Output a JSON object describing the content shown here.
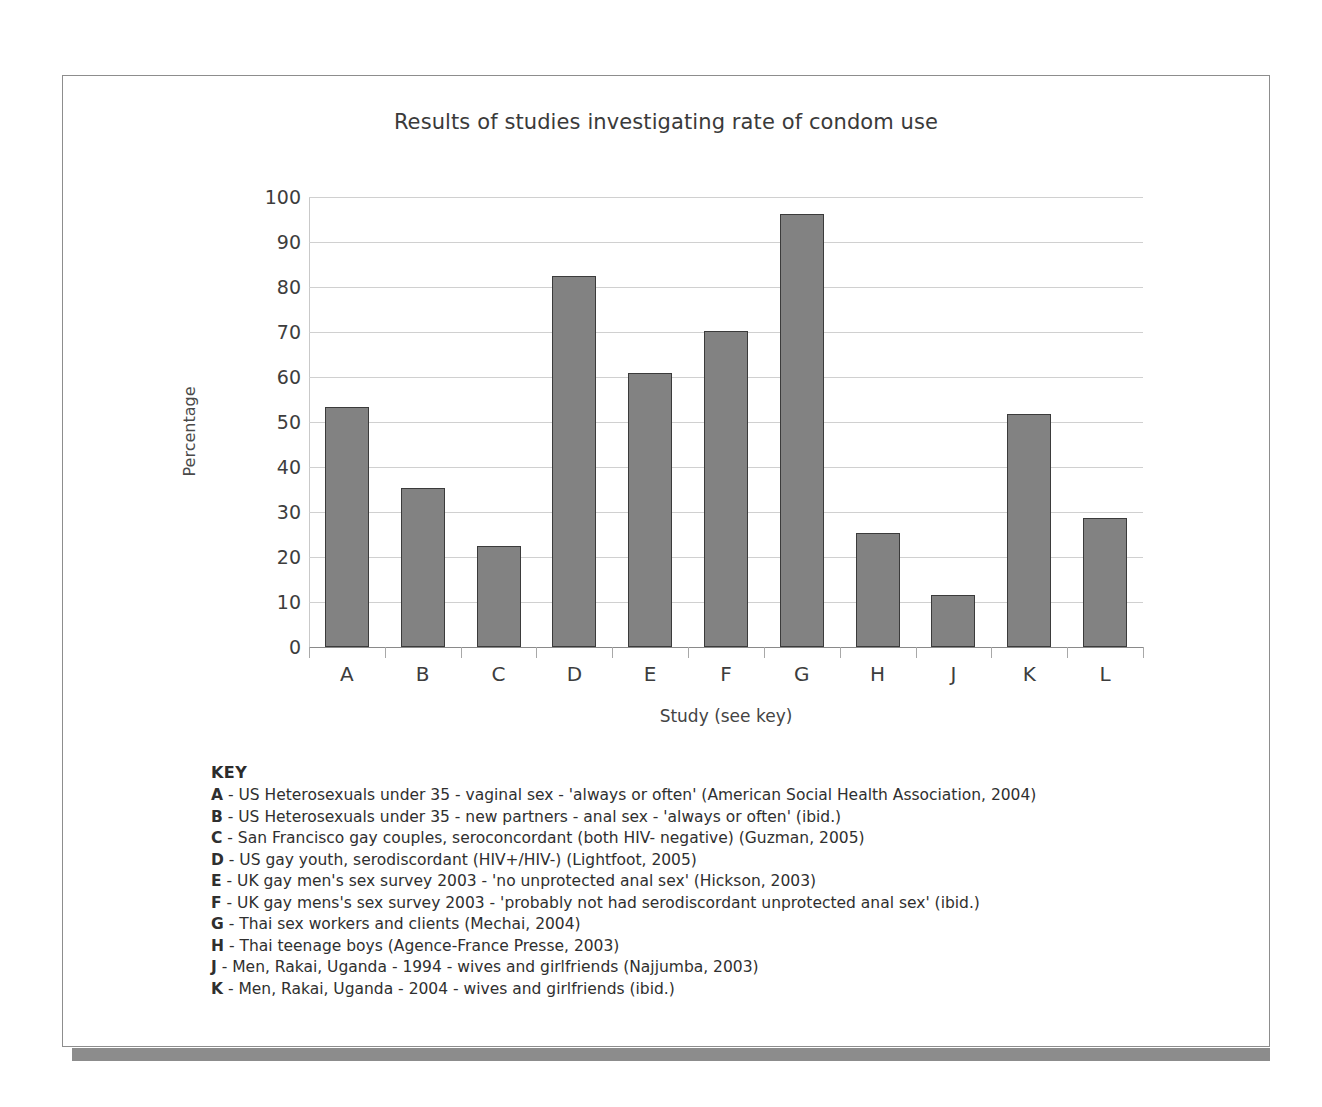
{
  "chart_data": {
    "type": "bar",
    "title": "Results of studies investigating rate of condom use",
    "xlabel": "Study (see key)",
    "ylabel": "Percentage",
    "ylim": [
      0,
      100
    ],
    "ytick_step": 10,
    "yticks": [
      "100",
      "90",
      "80",
      "70",
      "60",
      "50",
      "40",
      "30",
      "20",
      "10",
      "0"
    ],
    "grid": true,
    "legend_position": "below-plot",
    "bar_color": "#828282",
    "bar_border_color": "#3b3b3b",
    "categories": [
      "A",
      "B",
      "C",
      "D",
      "E",
      "F",
      "G",
      "H",
      "J",
      "K",
      "L"
    ],
    "values": [
      53.3,
      35.4,
      22.4,
      82.5,
      60.9,
      70.2,
      96.2,
      25.4,
      11.5,
      51.8,
      28.7
    ]
  },
  "key": {
    "heading": "KEY",
    "entries": [
      {
        "letter": "A",
        "text": "- US Heterosexuals under 35 - vaginal sex - 'always or often' (American Social Health Association, 2004)"
      },
      {
        "letter": "B",
        "text": "- US Heterosexuals under 35 - new partners - anal sex - 'always or often' (ibid.)"
      },
      {
        "letter": "C",
        "text": "- San Francisco gay couples, seroconcordant (both HIV- negative) (Guzman, 2005)"
      },
      {
        "letter": "D",
        "text": "- US gay youth, serodiscordant (HIV+/HIV-) (Lightfoot, 2005)"
      },
      {
        "letter": "E",
        "text": "- UK gay men's sex survey 2003 - 'no unprotected anal sex' (Hickson, 2003)"
      },
      {
        "letter": "F",
        "text": "- UK gay mens's sex survey 2003 - 'probably not had serodiscordant unprotected anal sex' (ibid.)"
      },
      {
        "letter": "G",
        "text": "- Thai sex workers and clients (Mechai, 2004)"
      },
      {
        "letter": "H",
        "text": "- Thai teenage boys (Agence-France Presse, 2003)"
      },
      {
        "letter": "J",
        "text": "- Men, Rakai, Uganda - 1994 - wives and girlfriends (Najjumba, 2003)"
      },
      {
        "letter": "K",
        "text": "- Men, Rakai, Uganda - 2004 - wives and girlfriends (ibid.)"
      }
    ]
  }
}
